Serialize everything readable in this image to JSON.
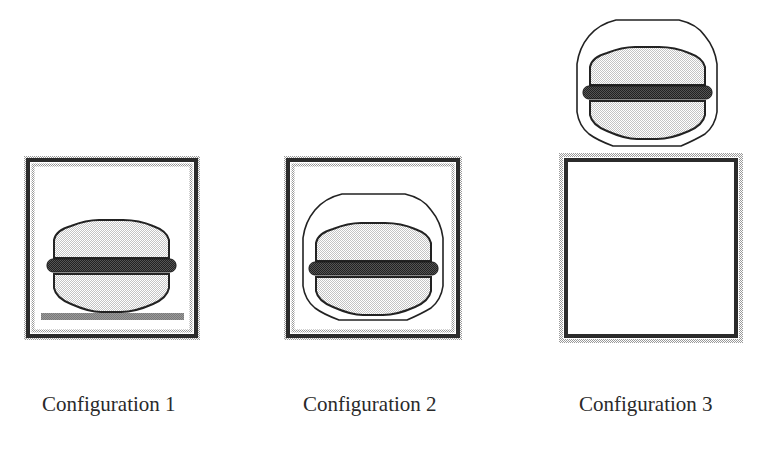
{
  "figure": {
    "configurations": [
      {
        "id": 1,
        "label": "Configuration 1",
        "description": "Burger inside box, resting on plate"
      },
      {
        "id": 2,
        "label": "Configuration 2",
        "description": "Burger inside box, enclosed by wrapper outline"
      },
      {
        "id": 3,
        "label": "Configuration 3",
        "description": "Burger with wrapper outline sitting on top of empty box"
      }
    ]
  },
  "colors": {
    "box_border": "#2b2b2b",
    "box_halo": "#b8b8b8",
    "bun_fill": "#cfcfcf",
    "patty": "#3a3a3a",
    "plate": "#8a8a8a",
    "outline": "#222222"
  }
}
